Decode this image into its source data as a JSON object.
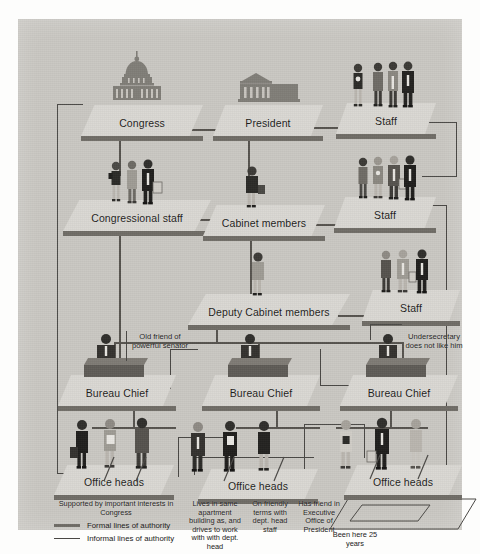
{
  "diagram": {
    "background_color": "#c9c7c2",
    "platform_top_color": "#d9d7d2",
    "platform_edge_color": "#6f6c66",
    "formal_line_color": "#56534e",
    "informal_line_color": "#4a4845"
  },
  "nodes": {
    "congress": "Congress",
    "president": "President",
    "staff_top": "Staff",
    "congressional_staff": "Congressional staff",
    "cabinet_members": "Cabinet members",
    "staff_mid": "Staff",
    "deputy_cabinet": "Deputy Cabinet members",
    "staff_low": "Staff",
    "bureau_chief_left": "Bureau Chief",
    "bureau_chief_center": "Bureau Chief",
    "bureau_chief_right": "Bureau Chief",
    "office_heads_left": "Office heads",
    "office_heads_center": "Office heads",
    "office_heads_right": "Office heads"
  },
  "annotations": {
    "old_friend": "Old friend of powerful senator",
    "undersecretary": "Undersecretary does not like him"
  },
  "captions": {
    "supported_by": "Supported by important interests in Congress",
    "lives_in_same": "Lives in same apartment building as, and drives to work with with dept. head",
    "on_friendly": "On friendly terms with dept. head staff",
    "has_friend": "Has friend in Executive Office of President",
    "been_here": "Been here 25 years"
  },
  "legend": {
    "formal": "Formal lines of authority",
    "informal": "Informal lines of authority"
  },
  "icons": {
    "capitol": "capitol-dome-icon",
    "white_house": "white-house-icon",
    "people_group": "people-group-icon",
    "woman": "woman-icon",
    "desk": "desk-official-icon"
  }
}
